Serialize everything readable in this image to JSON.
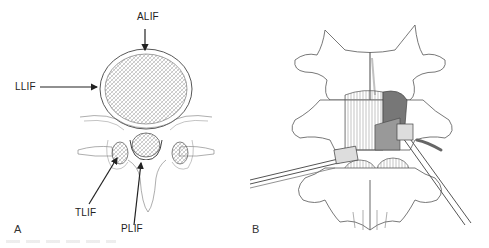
{
  "figure": {
    "panels": [
      {
        "id": "A",
        "letter": "A",
        "description": "Axial view of lumbar vertebra with arrows showing interbody fusion approaches",
        "labels": {
          "alif": "ALIF",
          "llif": "LLIF",
          "tlif": "TLIF",
          "plif": "PLIF"
        }
      },
      {
        "id": "B",
        "letter": "B",
        "description": "Posterior view of lumbar spine with instruments inserted into disc space"
      }
    ],
    "colors": {
      "background": "#ffffff",
      "line": "#333333",
      "arrow": "#222222",
      "shade": "#777777"
    }
  }
}
